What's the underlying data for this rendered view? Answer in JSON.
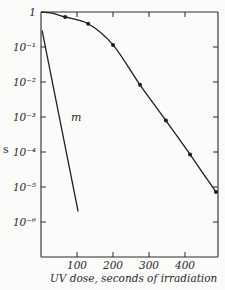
{
  "chart_data": {
    "type": "line",
    "title": "",
    "xlabel": "UV dose, seconds of irradiation",
    "ylabel": "s",
    "x_scale": "linear",
    "y_scale": "log",
    "xlim": [
      0,
      492
    ],
    "ylim": [
      1e-07,
      1
    ],
    "x_ticks": [
      100,
      200,
      300,
      400
    ],
    "x_tick_labels": [
      "100",
      "200",
      "300",
      "400"
    ],
    "y_ticks": [
      1,
      0.1,
      0.01,
      0.001,
      0.0001,
      1e-05,
      1e-06
    ],
    "y_tick_labels": [
      "1",
      "10⁻¹",
      "10⁻²",
      "10⁻³",
      "10⁻⁴",
      "10⁻⁵",
      "10⁻⁶"
    ],
    "grid": false,
    "series": [
      {
        "name": "survival curve (points)",
        "style": "smooth line with filled circle markers",
        "x": [
          67,
          131,
          200,
          275,
          347,
          414,
          486
        ],
        "y": [
          0.72,
          0.46,
          0.115,
          0.0083,
          0.00079,
          8.5e-05,
          7.2e-06
        ]
      },
      {
        "name": "m",
        "style": "straight line, no markers",
        "x": [
          3,
          103
        ],
        "y": [
          0.3,
          2e-06
        ]
      }
    ],
    "annotations": [
      {
        "text": "m",
        "x": 72,
        "y": 0.001
      }
    ]
  },
  "labels": {
    "y_axis": "s",
    "x_axis": "UV dose, seconds of irradiation",
    "series_m": "m"
  }
}
